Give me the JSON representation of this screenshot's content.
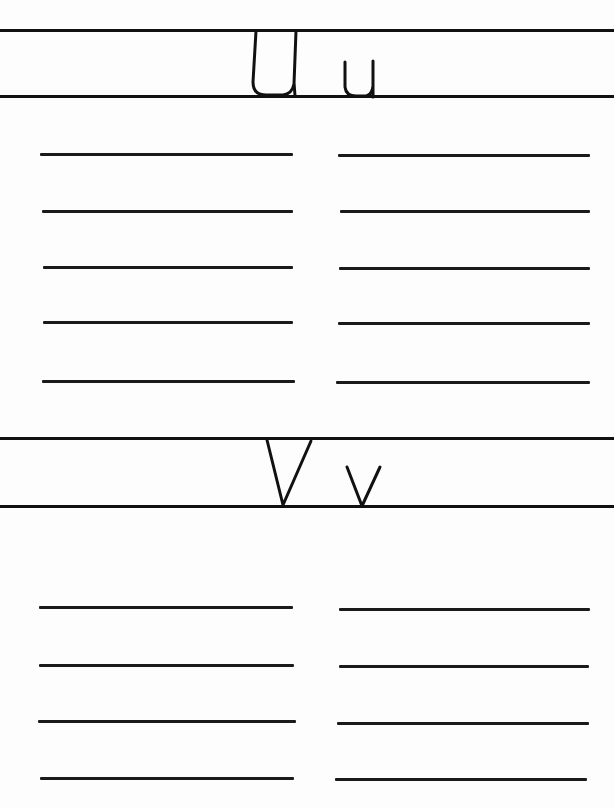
{
  "worksheet": {
    "sections": [
      {
        "id": "u",
        "letters": "U u",
        "uppercase": "U",
        "lowercase": "u",
        "practice_lines": 5
      },
      {
        "id": "v",
        "letters": "V v",
        "uppercase": "V",
        "lowercase": "v",
        "practice_lines": 4
      }
    ],
    "ink_color": "#111111",
    "paper_color": "#fdfdfd"
  }
}
